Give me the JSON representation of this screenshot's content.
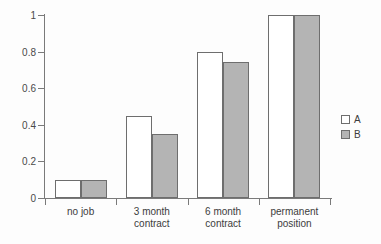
{
  "chart_data": {
    "type": "bar",
    "title": "",
    "subtitle": "",
    "xlabel": "",
    "ylabel": "",
    "ylim": [
      0,
      1
    ],
    "ytick_labels": [
      "0",
      "0.2",
      "0.4",
      "0.6",
      "0.8",
      "1"
    ],
    "ytick_values": [
      0,
      0.2,
      0.4,
      0.6,
      0.8,
      1
    ],
    "grid": false,
    "legend_position": "right",
    "categories": [
      "no job",
      "3 month\ncontract",
      "6 month\ncontract",
      "permanent\nposition"
    ],
    "series": [
      {
        "name": "A",
        "color": "#ffffff",
        "edge_color": "#6e6e6e",
        "values": [
          0.1,
          0.45,
          0.8,
          1.0
        ]
      },
      {
        "name": "B",
        "color": "#b4b4b4",
        "edge_color": "#6e6e6e",
        "values": [
          0.1,
          0.35,
          0.745,
          1.0
        ]
      }
    ]
  },
  "legend": {
    "entries": [
      {
        "label": "A"
      },
      {
        "label": "B"
      }
    ]
  },
  "axes": {
    "y_labels": [
      "1",
      "0.8",
      "0.6",
      "0.4",
      "0.2",
      "0"
    ],
    "x_labels": [
      "no job",
      "3 month\ncontract",
      "6 month\ncontract",
      "permanent\nposition"
    ]
  },
  "colors": {
    "background": "#fdfdfd",
    "axis": "#7a7a7a",
    "bar_a_fill": "#ffffff",
    "bar_b_fill": "#b4b4b4",
    "bar_edge": "#6e6e6e",
    "text": "#3c3c3c"
  }
}
